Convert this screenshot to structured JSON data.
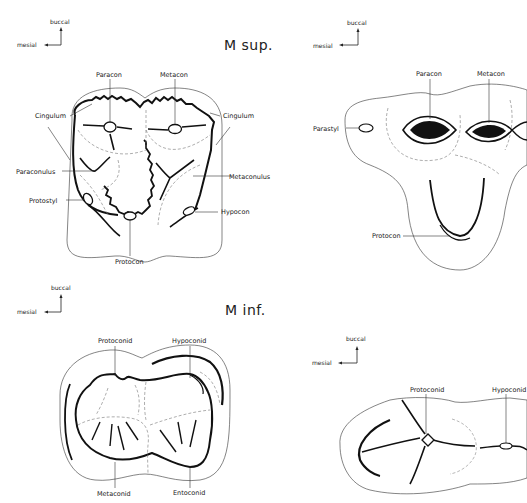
{
  "figure": {
    "upper_molar": {
      "title": "M sup.",
      "orientation": {
        "vertical": "buccal",
        "horizontal": "mesial"
      },
      "left_view": {
        "labels": [
          "Paracon",
          "Metacon",
          "Cingulum",
          "Cingulum",
          "Paraconulus",
          "Metaconulus",
          "Protostyl",
          "Hypocon",
          "Protocon"
        ]
      },
      "right_view": {
        "orientation": {
          "vertical": "buccal",
          "horizontal": "mesial"
        },
        "labels": [
          "Paracon",
          "Metacon",
          "Parastyl",
          "Protocon"
        ]
      }
    },
    "lower_molar": {
      "title": "M inf.",
      "orientation": {
        "vertical": "buccal",
        "horizontal": "mesial"
      },
      "left_view": {
        "labels": [
          "Protoconid",
          "Hypoconid",
          "Metaconid",
          "Entoconid"
        ]
      },
      "right_view": {
        "orientation": {
          "vertical": "buccal",
          "horizontal": "mesial"
        },
        "labels": [
          "Protoconid",
          "Hypoconid"
        ]
      }
    }
  }
}
